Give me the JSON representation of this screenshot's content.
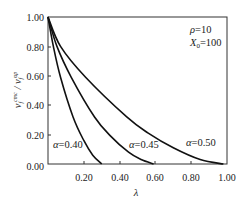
{
  "chart_data": {
    "type": "line",
    "title": "",
    "xlabel": "λ",
    "ylabel": "v_f^cmc / v_f^up",
    "xlim": [
      0,
      1.0
    ],
    "ylim": [
      0,
      1.0
    ],
    "grid": false,
    "x_ticks": [
      "0.20",
      "0.40",
      "0.60",
      "0.80",
      "1.00"
    ],
    "y_ticks": [
      "0.00",
      "0.20",
      "0.40",
      "0.60",
      "0.80",
      "1.00"
    ],
    "parameters": {
      "rho": "ρ=10",
      "X0": "X₀=100"
    },
    "series": [
      {
        "name": "α=0.40",
        "x": [
          0.0,
          0.03,
          0.07,
          0.14,
          0.2,
          0.25,
          0.3
        ],
        "y": [
          1.0,
          0.8,
          0.59,
          0.32,
          0.16,
          0.06,
          0.0
        ]
      },
      {
        "name": "α=0.45",
        "x": [
          0.0,
          0.05,
          0.13,
          0.26,
          0.35,
          0.45,
          0.52,
          0.59
        ],
        "y": [
          1.0,
          0.8,
          0.59,
          0.32,
          0.19,
          0.08,
          0.03,
          0.0
        ]
      },
      {
        "name": "α=0.50",
        "x": [
          0.0,
          0.07,
          0.21,
          0.44,
          0.56,
          0.7,
          0.85,
          0.98
        ],
        "y": [
          1.0,
          0.8,
          0.59,
          0.32,
          0.21,
          0.11,
          0.03,
          0.0
        ]
      }
    ],
    "annotations": [
      {
        "text": "α=0.40",
        "x": 0.03,
        "y": 0.12
      },
      {
        "text": "α=0.45",
        "x": 0.4,
        "y": 0.14
      },
      {
        "text": "α=0.50",
        "x": 0.7,
        "y": 0.15
      }
    ]
  },
  "labels": {
    "rho": "ρ=10",
    "x0": "X",
    "x0_sub": "0",
    "x0_val": "=100",
    "xlabel": "λ",
    "ylabel_v": "v",
    "ylabel_sup1": "cmc",
    "ylabel_sub": "f",
    "ylabel_slash": " / v",
    "ylabel_sup2": "up",
    "alpha40": "α=0.40",
    "alpha45": "α=0.45",
    "alpha50": "α=0.50",
    "y_ticks": [
      "1.00",
      "0.80",
      "0.60",
      "0.40",
      "0.20",
      "0.00"
    ],
    "x_ticks": [
      "0.20",
      "0.40",
      "0.60",
      "0.80",
      "1.00"
    ]
  }
}
